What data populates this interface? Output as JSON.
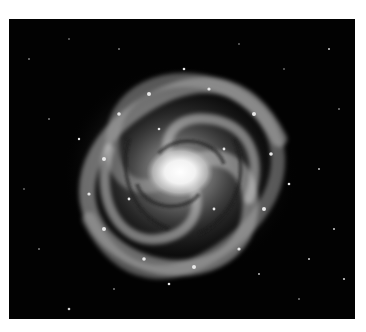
{
  "image": {
    "subject": "spiral galaxy (face-on, grayscale)",
    "background_color": "#ffffff",
    "sky_color": "#020202",
    "core_color": "#ffffff"
  }
}
